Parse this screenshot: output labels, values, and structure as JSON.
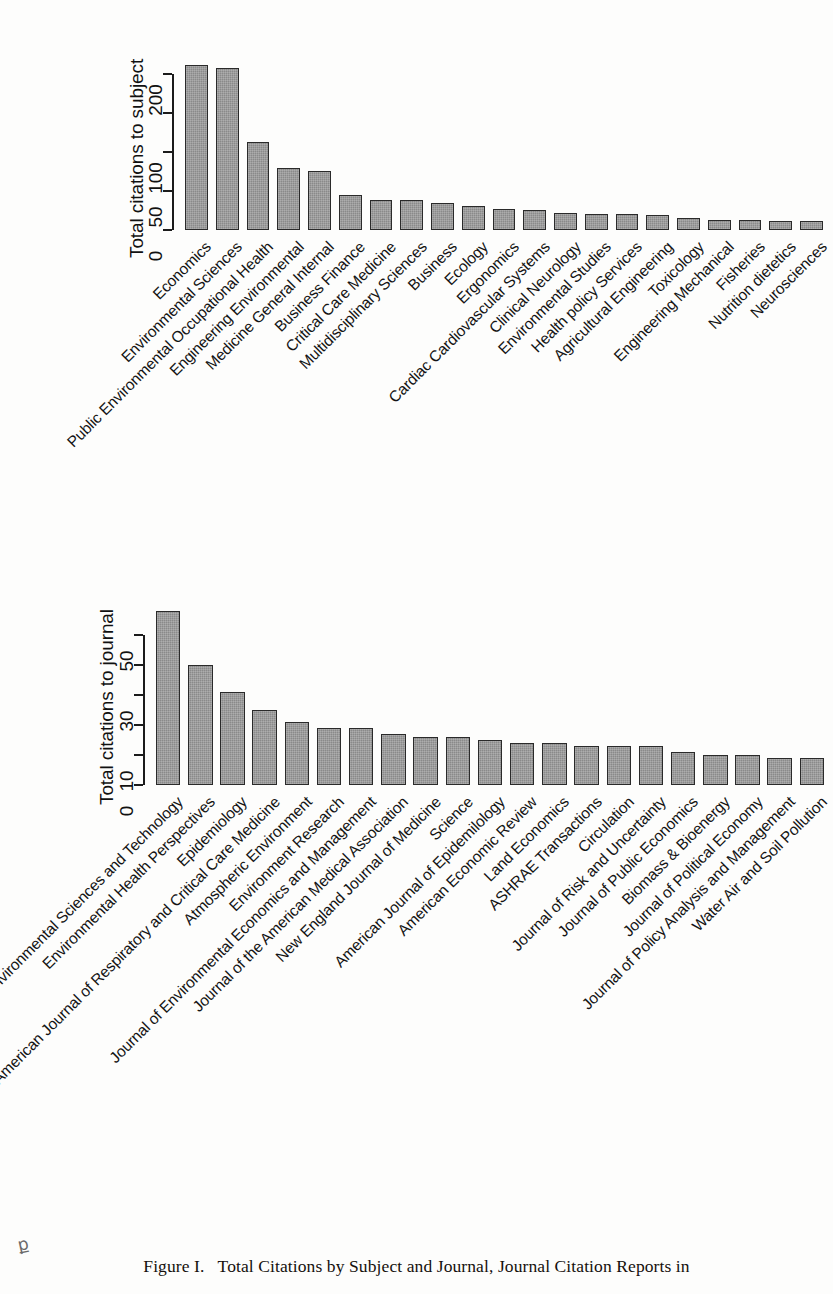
{
  "figure": {
    "caption_prefix": "Figure",
    "caption_number": "I.",
    "caption_text": "Total Citations by Subject and Journal, Journal Citation Reports in",
    "corner_mark": "ք"
  },
  "chart_data": [
    {
      "type": "bar",
      "title": "",
      "ylabel": "Total citations to subject",
      "xlabel": "",
      "ylim": [
        0,
        220
      ],
      "yticks": [
        0,
        50,
        100,
        150,
        200
      ],
      "ytick_labels": [
        "0",
        "50",
        "100",
        "",
        "200"
      ],
      "grid": false,
      "legend": "none",
      "bar_color": "#8a8a8a",
      "categories": [
        "Economics",
        "Environmental Sciences",
        "Public Environmental Occupational Health",
        "Engineering Environmental",
        "Medicine General Internal",
        "Business Finance",
        "Critical Care Medicine",
        "Multidisciplinary Sciences",
        "Business",
        "Ecology",
        "Ergonomics",
        "Cardiac Cardiovascular Systems",
        "Clinical Neurology",
        "Environmental Studies",
        "Health policy Services",
        "Agricultural Engineering",
        "Toxicology",
        "Engineering Mechanical",
        "Fisheries",
        "Nutrition dietetics",
        "Neurosciences"
      ],
      "values": [
        211,
        207,
        113,
        79,
        75,
        45,
        39,
        38,
        34,
        31,
        27,
        26,
        22,
        21,
        21,
        19,
        15,
        13,
        13,
        12,
        11
      ]
    },
    {
      "type": "bar",
      "title": "",
      "ylabel": "Total citations to journal",
      "xlabel": "",
      "ylim": [
        0,
        60
      ],
      "yticks": [
        0,
        10,
        20,
        30,
        40,
        50
      ],
      "ytick_labels": [
        "0",
        "10",
        "",
        "30",
        "",
        "50"
      ],
      "grid": false,
      "legend": "none",
      "bar_color": "#8a8a8a",
      "categories": [
        "Environmental Sciences and Technology",
        "Environmental Health Perspectives",
        "Epidemiology",
        "American Journal of Respiratory and Critical Care Medicine",
        "Atmospheric Environment",
        "Environment Research",
        "Journal of Environmental Economics and Management",
        "Journal of the American Medical Association",
        "New England Journal of Medicine",
        "Science",
        "American Journal of Epidemilology",
        "American Economic Review",
        "Land Economics",
        "ASHRAE Transactions",
        "Circulation",
        "Journal of Risk and Uncertainty",
        "Journal of Public Economics",
        "Biomass & Bioenergy",
        "Journal of Political Economy",
        "Journal of Policy Analysis and Management",
        "Water Air and Soil Pollution"
      ],
      "values": [
        58,
        40,
        31,
        25,
        21,
        19,
        19,
        17,
        16,
        16,
        15,
        14,
        14,
        13,
        13,
        13,
        11,
        10,
        10,
        9,
        9
      ]
    }
  ]
}
